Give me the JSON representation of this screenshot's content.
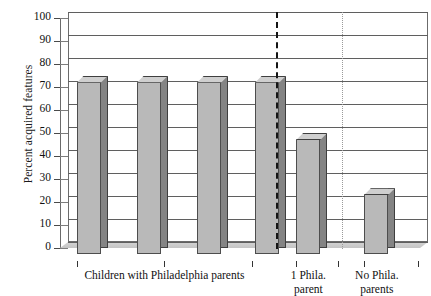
{
  "chart_data": {
    "type": "bar",
    "title": "",
    "xlabel": "",
    "ylabel": "Percent acquired features",
    "ylim": [
      0,
      100
    ],
    "ytick_step": 10,
    "yticks": [
      "100",
      "90",
      "80",
      "70",
      "60",
      "50",
      "40",
      "30",
      "20",
      "10",
      "0"
    ],
    "grid": true,
    "legend": "none",
    "style": "3d-bars",
    "categories": [
      "Children with Philadelphia parents",
      "Children with Philadelphia parents",
      "Children with Philadelphia parents",
      "Children with Philadelphia parents",
      "1 Phila. parent",
      "No Phila. parents"
    ],
    "values": [
      75,
      75,
      75,
      75,
      50,
      26
    ],
    "group_labels": [
      {
        "text": "Children with Philadelphia parents",
        "lines": [
          "Children with Philadelphia parents"
        ],
        "center_pct": 29.0
      },
      {
        "text": "1 Phila. parent",
        "lines": [
          "1 Phila.",
          "parent"
        ],
        "center_pct": 69.0
      },
      {
        "text": "No Phila. parents",
        "lines": [
          "No Phila.",
          "parents"
        ],
        "center_pct": 88.0
      }
    ],
    "dividers": [
      {
        "name": "group-divider-thick",
        "style": "thick-dashed",
        "x_pct": 58.9,
        "color": "#141414"
      },
      {
        "name": "group-divider-thin",
        "style": "thin-dotted",
        "x_pct": 77.2,
        "color": "#9a9a9a"
      }
    ],
    "bars": [
      {
        "name": "bar-1",
        "value": 75,
        "left_pct": 4.7,
        "width_pct": 6.7
      },
      {
        "name": "bar-2",
        "value": 75,
        "left_pct": 21.4,
        "width_pct": 6.7
      },
      {
        "name": "bar-3",
        "value": 75,
        "left_pct": 38.1,
        "width_pct": 6.7
      },
      {
        "name": "bar-4",
        "value": 75,
        "left_pct": 54.2,
        "width_pct": 6.7
      },
      {
        "name": "bar-5",
        "value": 50,
        "left_pct": 65.6,
        "width_pct": 6.7
      },
      {
        "name": "bar-6",
        "value": 26,
        "left_pct": 84.4,
        "width_pct": 6.7
      }
    ],
    "xticks_pct": [
      4.7,
      29.0,
      53.3,
      65.6,
      77.2,
      84.4,
      99.5
    ],
    "colors": {
      "bar_face": "#b9b9b9",
      "bar_side": "#848484",
      "bar_top": "#cfcfcf",
      "bar_outline": "#4d4d4d",
      "gridline": "#5f5f5f",
      "axis": "#6b6b6b",
      "text": "#111111",
      "background": "#ffffff"
    }
  }
}
